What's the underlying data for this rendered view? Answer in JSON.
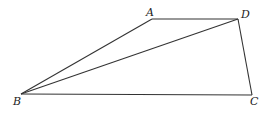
{
  "diagram": {
    "type": "geometry",
    "points": {
      "A": {
        "label": "A",
        "x": 152,
        "y": 19
      },
      "D": {
        "label": "D",
        "x": 238,
        "y": 19
      },
      "B": {
        "label": "B",
        "x": 21,
        "y": 94
      },
      "C": {
        "label": "C",
        "x": 252,
        "y": 95
      }
    },
    "segments": [
      [
        "A",
        "D"
      ],
      [
        "A",
        "B"
      ],
      [
        "B",
        "D"
      ],
      [
        "B",
        "C"
      ],
      [
        "D",
        "C"
      ]
    ],
    "labels": {
      "A": "A",
      "B": "B",
      "C": "C",
      "D": "D"
    },
    "colors": {
      "line": "#333333",
      "background": "#ffffff"
    }
  }
}
